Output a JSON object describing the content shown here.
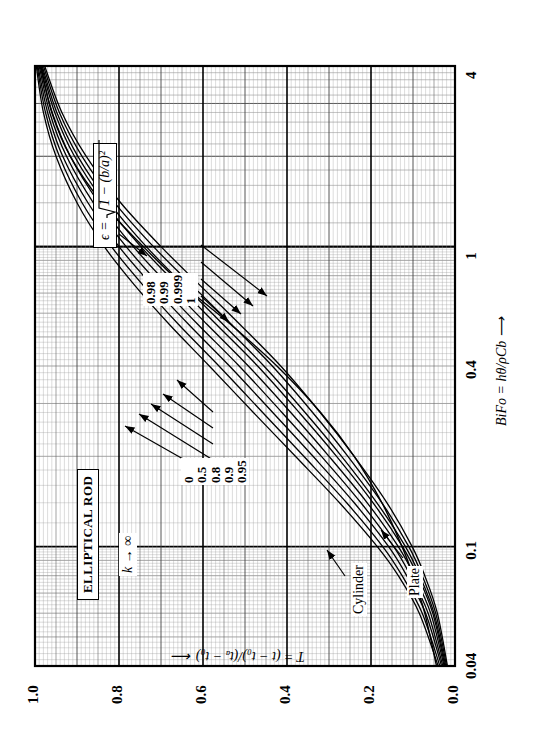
{
  "figure": {
    "title_box": "ELLIPTICAL ROD",
    "k_annotation": "k → ∞",
    "epsilon_formula": "ϵ = √(1 − (b/a)²)",
    "epsilon_parts": {
      "symbol": "ϵ",
      "equals": "=",
      "radicand": "1 − (b/a)²"
    },
    "annotations": [
      {
        "name": "cylinder",
        "text": "Cylinder"
      },
      {
        "name": "plate",
        "text": "Plate"
      }
    ]
  },
  "chart_data": {
    "type": "line",
    "title": "ELLIPTICAL ROD",
    "xlabel": "BiFo = hθ/ρCb  ⟶",
    "ylabel": "T = (t − t₀)/(tₐ − t₀)  ⟵",
    "xscale": "log",
    "yscale": "linear",
    "xlim": [
      0.04,
      4
    ],
    "ylim": [
      0.0,
      1.0
    ],
    "xticks": [
      "0.04",
      "0.1",
      "0.4",
      "1",
      "4"
    ],
    "xtick_values": [
      0.04,
      0.1,
      0.4,
      1,
      4
    ],
    "yticks": [
      "0.0",
      "0.2",
      "0.4",
      "0.6",
      "0.8",
      "1.0"
    ],
    "ytick_values": [
      0.0,
      0.2,
      0.4,
      0.6,
      0.8,
      1.0
    ],
    "grid": "log-log engineering grid, minor + major",
    "legend_position": "inline callout labels with leader arrows",
    "series_parameter": "ϵ = √(1 − (b/a)²)",
    "left_group_labels": [
      "0",
      "0.5",
      "0.8",
      "0.9",
      "0.95"
    ],
    "right_group_labels": [
      "0.98",
      "0.99",
      "0.999",
      "1"
    ],
    "series": [
      {
        "name": "0",
        "x": [
          0.04,
          0.06,
          0.08,
          0.1,
          0.14,
          0.2,
          0.28,
          0.4,
          0.55,
          0.75,
          1.0,
          1.4,
          2.0,
          2.8,
          4.0
        ],
        "values": [
          0.04,
          0.085,
          0.135,
          0.185,
          0.275,
          0.38,
          0.48,
          0.585,
          0.68,
          0.765,
          0.835,
          0.9,
          0.95,
          0.98,
          0.997
        ]
      },
      {
        "name": "0.5",
        "x": [
          0.04,
          0.06,
          0.08,
          0.1,
          0.14,
          0.2,
          0.28,
          0.4,
          0.55,
          0.75,
          1.0,
          1.4,
          2.0,
          2.8,
          4.0
        ],
        "values": [
          0.036,
          0.078,
          0.126,
          0.172,
          0.258,
          0.36,
          0.458,
          0.562,
          0.658,
          0.745,
          0.818,
          0.888,
          0.942,
          0.975,
          0.995
        ]
      },
      {
        "name": "0.8",
        "x": [
          0.04,
          0.06,
          0.08,
          0.1,
          0.14,
          0.2,
          0.28,
          0.4,
          0.55,
          0.75,
          1.0,
          1.4,
          2.0,
          2.8,
          4.0
        ],
        "values": [
          0.032,
          0.07,
          0.115,
          0.158,
          0.24,
          0.338,
          0.434,
          0.537,
          0.634,
          0.724,
          0.8,
          0.874,
          0.934,
          0.97,
          0.993
        ]
      },
      {
        "name": "0.9",
        "x": [
          0.04,
          0.06,
          0.08,
          0.1,
          0.14,
          0.2,
          0.28,
          0.4,
          0.55,
          0.75,
          1.0,
          1.4,
          2.0,
          2.8,
          4.0
        ],
        "values": [
          0.029,
          0.064,
          0.106,
          0.146,
          0.224,
          0.318,
          0.412,
          0.514,
          0.612,
          0.704,
          0.783,
          0.861,
          0.925,
          0.965,
          0.99
        ]
      },
      {
        "name": "0.95",
        "x": [
          0.04,
          0.06,
          0.08,
          0.1,
          0.14,
          0.2,
          0.28,
          0.4,
          0.55,
          0.75,
          1.0,
          1.4,
          2.0,
          2.8,
          4.0
        ],
        "values": [
          0.026,
          0.058,
          0.097,
          0.135,
          0.209,
          0.3,
          0.391,
          0.492,
          0.59,
          0.684,
          0.766,
          0.848,
          0.916,
          0.959,
          0.988
        ]
      },
      {
        "name": "0.98",
        "x": [
          0.04,
          0.06,
          0.08,
          0.1,
          0.14,
          0.2,
          0.28,
          0.4,
          0.55,
          0.75,
          1.0,
          1.4,
          2.0,
          2.8,
          4.0
        ],
        "values": [
          0.024,
          0.053,
          0.089,
          0.125,
          0.195,
          0.282,
          0.371,
          0.47,
          0.568,
          0.663,
          0.748,
          0.834,
          0.906,
          0.953,
          0.985
        ]
      },
      {
        "name": "0.99",
        "x": [
          0.04,
          0.06,
          0.08,
          0.1,
          0.14,
          0.2,
          0.28,
          0.4,
          0.55,
          0.75,
          1.0,
          1.4,
          2.0,
          2.8,
          4.0
        ],
        "values": [
          0.022,
          0.05,
          0.084,
          0.118,
          0.186,
          0.27,
          0.357,
          0.455,
          0.552,
          0.648,
          0.735,
          0.823,
          0.898,
          0.948,
          0.983
        ]
      },
      {
        "name": "0.999",
        "x": [
          0.04,
          0.06,
          0.08,
          0.1,
          0.14,
          0.2,
          0.28,
          0.4,
          0.55,
          0.75,
          1.0,
          1.4,
          2.0,
          2.8,
          4.0
        ],
        "values": [
          0.02,
          0.046,
          0.078,
          0.11,
          0.174,
          0.255,
          0.339,
          0.435,
          0.532,
          0.629,
          0.718,
          0.81,
          0.888,
          0.942,
          0.98
        ]
      },
      {
        "name": "1",
        "x": [
          0.04,
          0.06,
          0.08,
          0.1,
          0.14,
          0.2,
          0.28,
          0.4,
          0.55,
          0.75,
          1.0,
          1.4,
          2.0,
          2.8,
          4.0
        ],
        "values": [
          0.018,
          0.042,
          0.072,
          0.102,
          0.162,
          0.24,
          0.321,
          0.415,
          0.512,
          0.61,
          0.7,
          0.796,
          0.878,
          0.936,
          0.977
        ]
      },
      {
        "name": "plate",
        "x": [
          0.04,
          0.06,
          0.08,
          0.1,
          0.14,
          0.2,
          0.28,
          0.4,
          0.55,
          0.75,
          1.0,
          1.4,
          2.0,
          2.8,
          4.0
        ],
        "values": [
          0.044,
          0.072,
          0.1,
          0.126,
          0.174,
          0.24,
          0.32,
          0.424,
          0.534,
          0.65,
          0.742,
          0.84,
          0.916,
          0.96,
          0.986
        ]
      }
    ]
  }
}
